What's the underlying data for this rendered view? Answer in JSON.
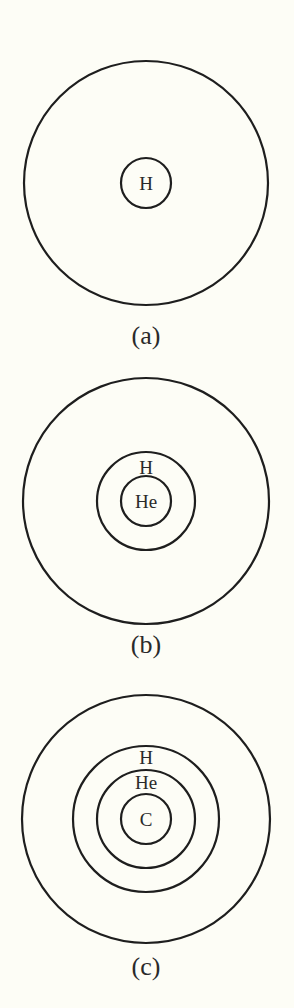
{
  "figure": {
    "panels": [
      {
        "caption": "(a)",
        "description": "Outer star envelope with hydrogen-burning core",
        "shells": [
          {
            "label": "",
            "role": "envelope"
          },
          {
            "label": "H",
            "role": "core"
          }
        ]
      },
      {
        "caption": "(b)",
        "description": "Outer envelope, hydrogen shell, helium core",
        "shells": [
          {
            "label": "",
            "role": "envelope"
          },
          {
            "label": "H",
            "role": "shell"
          },
          {
            "label": "He",
            "role": "core"
          }
        ]
      },
      {
        "caption": "(c)",
        "description": "Outer envelope, hydrogen shell, helium shell, carbon core",
        "shells": [
          {
            "label": "",
            "role": "envelope"
          },
          {
            "label": "H",
            "role": "shell"
          },
          {
            "label": "He",
            "role": "shell"
          },
          {
            "label": "C",
            "role": "core"
          }
        ]
      }
    ],
    "colors": {
      "background": "#fdfdf6",
      "stroke": "#1e1e1e",
      "text": "#2a2a2a"
    }
  }
}
